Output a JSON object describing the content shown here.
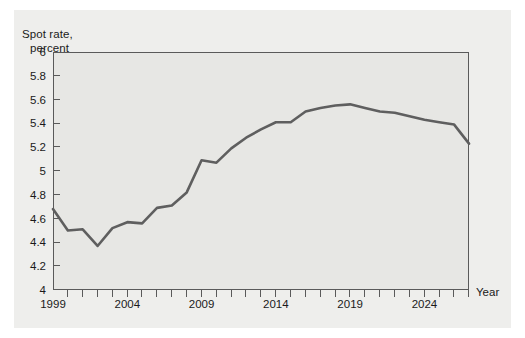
{
  "figure": {
    "background_color": "#ffffff",
    "panel_color": "#eeeeec",
    "plot_background_color": "#e7e7e4",
    "frame_color": "#5a5a5a",
    "series_color": "#5f5f5f"
  },
  "labels": {
    "y_axis_title_line1": "Spot rate,",
    "y_axis_title_line2": "percent",
    "x_axis_title": "Year"
  },
  "chart_data": {
    "type": "line",
    "title": "",
    "subtitle": "",
    "xlabel": "Year",
    "ylabel": "Spot rate, percent",
    "xlim": [
      1999,
      2027
    ],
    "ylim": [
      4,
      6
    ],
    "grid": false,
    "legend": "none",
    "y_ticks": [
      4,
      4.2,
      4.4,
      4.6,
      4.8,
      5,
      5.2,
      5.4,
      5.6,
      5.8,
      6
    ],
    "y_tick_labels": [
      "4",
      "4.2",
      "4.4",
      "4.6",
      "4.8",
      "5",
      "5.2",
      "5.4",
      "5.6",
      "5.8",
      "6"
    ],
    "x_ticks": [
      1999,
      2000,
      2001,
      2002,
      2003,
      2004,
      2005,
      2006,
      2007,
      2008,
      2009,
      2010,
      2011,
      2012,
      2013,
      2014,
      2015,
      2016,
      2017,
      2018,
      2019,
      2020,
      2021,
      2022,
      2023,
      2024,
      2025,
      2026,
      2027
    ],
    "x_tick_labels_major": [
      "1999",
      "2004",
      "2009",
      "2014",
      "2019",
      "2024"
    ],
    "x_major_values": [
      1999,
      2004,
      2009,
      2014,
      2019,
      2024
    ],
    "series": [
      {
        "name": "Spot rate",
        "x": [
          1999,
          2000,
          2001,
          2002,
          2003,
          2004,
          2005,
          2006,
          2007,
          2008,
          2009,
          2010,
          2011,
          2012,
          2013,
          2014,
          2015,
          2016,
          2017,
          2018,
          2019,
          2020,
          2021,
          2022,
          2023,
          2024,
          2025,
          2026,
          2027
        ],
        "values": [
          4.68,
          4.5,
          4.51,
          4.37,
          4.52,
          4.57,
          4.56,
          4.69,
          4.71,
          4.82,
          5.09,
          5.07,
          5.19,
          5.28,
          5.35,
          5.41,
          5.41,
          5.5,
          5.53,
          5.55,
          5.56,
          5.53,
          5.5,
          5.49,
          5.46,
          5.43,
          5.41,
          5.39,
          5.23
        ]
      }
    ]
  }
}
